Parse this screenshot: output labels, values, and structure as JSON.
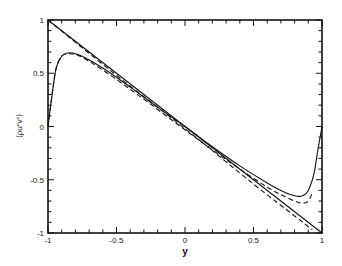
{
  "chart_data": {
    "type": "line",
    "title": "",
    "xlabel": "y",
    "ylabel": "⟨ρu″v″⟩",
    "xlim": [
      -1,
      1
    ],
    "ylim": [
      -1,
      1
    ],
    "grid": false,
    "legend": null,
    "x_ticks": [
      "-1",
      "-0.5",
      "0",
      "0.5",
      "1"
    ],
    "y_ticks": [
      "1",
      "0.5",
      "0",
      "-0.5",
      "-1"
    ],
    "x_tick_values": [
      -1,
      -0.5,
      0,
      0.5,
      1
    ],
    "y_tick_values": [
      1,
      0.5,
      0,
      -0.5,
      -1
    ],
    "minor_tick_step": 0.1,
    "series": [
      {
        "name": "total stress (solid, linear)",
        "style": "solid",
        "x": [
          -1,
          1
        ],
        "y": [
          1,
          -1
        ]
      },
      {
        "name": "total stress (dashed, linear)",
        "style": "dashed",
        "x": [
          -1,
          -0.5,
          0,
          0.5,
          0.8,
          0.93
        ],
        "y": [
          1,
          0.48,
          -0.02,
          -0.54,
          -0.84,
          -0.97
        ]
      },
      {
        "name": "Reynolds shear stress (solid)",
        "style": "solid",
        "x": [
          -1,
          -0.97,
          -0.94,
          -0.9,
          -0.86,
          -0.82,
          -0.75,
          -0.6,
          -0.4,
          -0.2,
          0,
          0.2,
          0.4,
          0.6,
          0.7,
          0.8,
          0.86,
          0.9,
          0.94,
          0.97,
          1
        ],
        "y": [
          0,
          0.3,
          0.55,
          0.66,
          0.69,
          0.69,
          0.66,
          0.55,
          0.37,
          0.18,
          0,
          -0.19,
          -0.37,
          -0.53,
          -0.6,
          -0.65,
          -0.65,
          -0.6,
          -0.45,
          -0.22,
          0
        ]
      },
      {
        "name": "Reynolds shear stress (dashed)",
        "style": "dashed",
        "x": [
          -1,
          -0.97,
          -0.94,
          -0.9,
          -0.86,
          -0.82,
          -0.75,
          -0.6,
          -0.4,
          -0.2,
          0,
          0.2,
          0.4,
          0.6,
          0.7,
          0.8,
          0.86,
          0.9,
          0.93
        ],
        "y": [
          0,
          0.3,
          0.55,
          0.66,
          0.68,
          0.68,
          0.65,
          0.53,
          0.35,
          0.16,
          -0.03,
          -0.22,
          -0.4,
          -0.57,
          -0.64,
          -0.7,
          -0.72,
          -0.7,
          -0.62
        ]
      }
    ]
  }
}
